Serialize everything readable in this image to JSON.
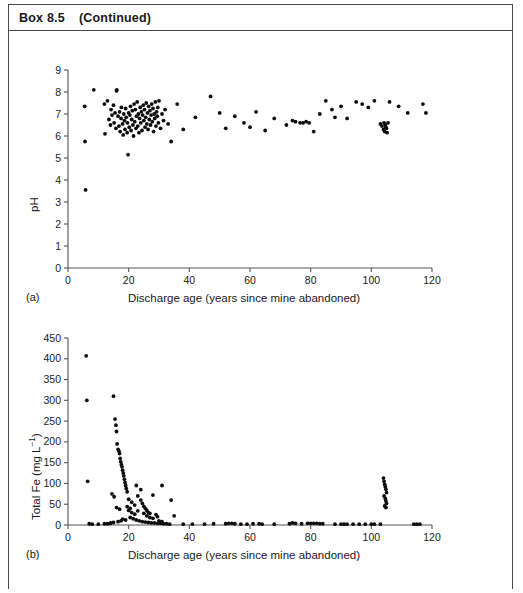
{
  "header": {
    "box_label": "Box 8.5",
    "continued_label": "(Continued)"
  },
  "chart_data": [
    {
      "type": "scatter",
      "panel": "(a)",
      "title": "",
      "xlabel": "Discharge age (years since mine abandoned)",
      "ylabel": "pH",
      "xlim": [
        0,
        120
      ],
      "ylim": [
        0,
        9
      ],
      "xticks": [
        0,
        20,
        40,
        60,
        80,
        100,
        120
      ],
      "yticks": [
        0,
        1,
        2,
        3,
        4,
        5,
        6,
        7,
        8,
        9
      ],
      "grid": false,
      "legend": "none",
      "marker": "filled-circle",
      "points": [
        [
          5.5,
          7.35
        ],
        [
          5.6,
          5.75
        ],
        [
          5.8,
          3.55
        ],
        [
          8.5,
          8.1
        ],
        [
          12.0,
          7.45
        ],
        [
          12.2,
          6.1
        ],
        [
          13.0,
          7.6
        ],
        [
          13.5,
          6.75
        ],
        [
          14.0,
          6.5
        ],
        [
          14.2,
          7.2
        ],
        [
          14.5,
          6.95
        ],
        [
          15.0,
          7.4
        ],
        [
          15.2,
          6.6
        ],
        [
          15.5,
          7.05
        ],
        [
          15.8,
          6.35
        ],
        [
          16.0,
          8.05
        ],
        [
          16.1,
          8.1
        ],
        [
          16.5,
          6.9
        ],
        [
          16.8,
          6.45
        ],
        [
          17.0,
          7.1
        ],
        [
          17.2,
          6.2
        ],
        [
          17.5,
          6.8
        ],
        [
          17.6,
          7.3
        ],
        [
          18.0,
          6.55
        ],
        [
          18.2,
          6.05
        ],
        [
          18.4,
          7.0
        ],
        [
          18.6,
          6.7
        ],
        [
          18.8,
          6.3
        ],
        [
          19.0,
          7.25
        ],
        [
          19.2,
          6.85
        ],
        [
          19.5,
          6.15
        ],
        [
          19.6,
          6.6
        ],
        [
          19.8,
          5.15
        ],
        [
          20.0,
          7.05
        ],
        [
          20.2,
          6.4
        ],
        [
          20.4,
          6.95
        ],
        [
          20.6,
          7.35
        ],
        [
          20.8,
          6.25
        ],
        [
          21.0,
          6.75
        ],
        [
          21.2,
          7.15
        ],
        [
          21.4,
          6.5
        ],
        [
          21.6,
          6.0
        ],
        [
          21.8,
          7.45
        ],
        [
          22.0,
          6.65
        ],
        [
          22.2,
          7.2
        ],
        [
          22.4,
          6.35
        ],
        [
          22.6,
          6.9
        ],
        [
          22.8,
          7.55
        ],
        [
          23.0,
          6.45
        ],
        [
          23.2,
          7.0
        ],
        [
          23.4,
          6.15
        ],
        [
          23.6,
          6.8
        ],
        [
          23.8,
          7.3
        ],
        [
          24.0,
          6.6
        ],
        [
          24.2,
          7.1
        ],
        [
          24.4,
          6.25
        ],
        [
          24.6,
          6.95
        ],
        [
          24.8,
          7.4
        ],
        [
          25.0,
          6.7
        ],
        [
          25.2,
          7.2
        ],
        [
          25.4,
          6.4
        ],
        [
          25.6,
          6.85
        ],
        [
          25.8,
          7.5
        ],
        [
          26.0,
          6.55
        ],
        [
          26.2,
          7.05
        ],
        [
          26.4,
          6.3
        ],
        [
          26.6,
          7.35
        ],
        [
          26.8,
          6.75
        ],
        [
          27.0,
          7.15
        ],
        [
          27.2,
          6.5
        ],
        [
          27.4,
          6.95
        ],
        [
          27.6,
          7.45
        ],
        [
          27.8,
          6.65
        ],
        [
          28.0,
          7.25
        ],
        [
          28.2,
          6.2
        ],
        [
          28.4,
          7.0
        ],
        [
          28.6,
          6.8
        ],
        [
          28.8,
          7.55
        ],
        [
          29.0,
          6.45
        ],
        [
          29.2,
          7.1
        ],
        [
          29.4,
          6.9
        ],
        [
          29.6,
          7.3
        ],
        [
          29.8,
          6.6
        ],
        [
          30.0,
          7.6
        ],
        [
          30.5,
          6.35
        ],
        [
          31.0,
          7.0
        ],
        [
          31.5,
          6.7
        ],
        [
          32.0,
          7.2
        ],
        [
          33.0,
          6.55
        ],
        [
          34.0,
          5.75
        ],
        [
          36.0,
          7.45
        ],
        [
          38.0,
          6.3
        ],
        [
          42.0,
          6.85
        ],
        [
          47.0,
          7.8
        ],
        [
          50.0,
          7.05
        ],
        [
          52.0,
          6.35
        ],
        [
          55.0,
          6.9
        ],
        [
          58.0,
          6.6
        ],
        [
          60.0,
          6.4
        ],
        [
          62.0,
          7.1
        ],
        [
          65.0,
          6.25
        ],
        [
          68.0,
          6.8
        ],
        [
          72.0,
          6.5
        ],
        [
          74.0,
          6.7
        ],
        [
          75.0,
          6.65
        ],
        [
          76.5,
          6.6
        ],
        [
          77.5,
          6.6
        ],
        [
          78.5,
          6.65
        ],
        [
          79.5,
          6.6
        ],
        [
          81.0,
          6.2
        ],
        [
          83.0,
          7.0
        ],
        [
          85.0,
          7.6
        ],
        [
          87.0,
          7.2
        ],
        [
          88.0,
          6.85
        ],
        [
          90.0,
          7.35
        ],
        [
          92.0,
          6.8
        ],
        [
          95.0,
          7.55
        ],
        [
          97.0,
          7.45
        ],
        [
          99.0,
          7.3
        ],
        [
          101.0,
          7.6
        ],
        [
          103.0,
          6.55
        ],
        [
          103.5,
          6.45
        ],
        [
          104.0,
          6.3
        ],
        [
          104.2,
          6.6
        ],
        [
          104.4,
          6.2
        ],
        [
          104.6,
          6.5
        ],
        [
          104.8,
          6.4
        ],
        [
          105.0,
          6.35
        ],
        [
          105.2,
          6.15
        ],
        [
          105.5,
          6.6
        ],
        [
          106.0,
          7.55
        ],
        [
          109.0,
          7.35
        ],
        [
          112.0,
          7.05
        ],
        [
          117.0,
          7.45
        ],
        [
          118.0,
          7.05
        ]
      ]
    },
    {
      "type": "scatter",
      "panel": "(b)",
      "title": "",
      "xlabel": "Discharge age (years since mine abandoned)",
      "ylabel": "Total Fe (mg L⁻¹)",
      "xlim": [
        0,
        120
      ],
      "ylim": [
        0,
        450
      ],
      "xticks": [
        0,
        20,
        40,
        60,
        80,
        100,
        120
      ],
      "yticks": [
        0,
        50,
        100,
        150,
        200,
        250,
        300,
        350,
        400,
        450
      ],
      "grid": false,
      "legend": "none",
      "marker": "filled-circle",
      "points": [
        [
          6.0,
          407
        ],
        [
          6.2,
          300
        ],
        [
          6.5,
          105
        ],
        [
          7.0,
          3
        ],
        [
          14.0,
          5
        ],
        [
          15.0,
          310
        ],
        [
          15.5,
          255
        ],
        [
          15.8,
          240
        ],
        [
          16.0,
          225
        ],
        [
          16.2,
          195
        ],
        [
          16.5,
          182
        ],
        [
          16.8,
          178
        ],
        [
          17.0,
          172
        ],
        [
          17.2,
          160
        ],
        [
          17.4,
          152
        ],
        [
          17.6,
          145
        ],
        [
          17.8,
          140
        ],
        [
          18.0,
          132
        ],
        [
          18.2,
          125
        ],
        [
          18.4,
          118
        ],
        [
          18.6,
          110
        ],
        [
          18.8,
          102
        ],
        [
          19.0,
          95
        ],
        [
          19.2,
          88
        ],
        [
          19.5,
          80
        ],
        [
          14.5,
          75
        ],
        [
          15.2,
          68
        ],
        [
          20.0,
          62
        ],
        [
          21.0,
          55
        ],
        [
          22.0,
          48
        ],
        [
          16.0,
          42
        ],
        [
          17.0,
          38
        ],
        [
          23.0,
          70
        ],
        [
          24.0,
          60
        ],
        [
          24.5,
          52
        ],
        [
          25.0,
          45
        ],
        [
          25.5,
          40
        ],
        [
          26.0,
          35
        ],
        [
          26.5,
          30
        ],
        [
          27.0,
          28
        ],
        [
          22.5,
          95
        ],
        [
          24.0,
          85
        ],
        [
          28.0,
          72
        ],
        [
          31.0,
          95
        ],
        [
          34.0,
          60
        ],
        [
          35.0,
          22
        ],
        [
          29.0,
          25
        ],
        [
          29.5,
          20
        ],
        [
          20.5,
          18
        ],
        [
          21.5,
          15
        ],
        [
          22.5,
          12
        ],
        [
          23.5,
          10
        ],
        [
          24.5,
          8
        ],
        [
          25.5,
          7
        ],
        [
          26.5,
          6
        ],
        [
          27.5,
          5
        ],
        [
          28.5,
          5
        ],
        [
          29.5,
          4
        ],
        [
          30.5,
          4
        ],
        [
          31.5,
          3
        ],
        [
          18.0,
          14
        ],
        [
          19.0,
          12
        ],
        [
          17.5,
          10
        ],
        [
          16.5,
          8
        ],
        [
          15.0,
          6
        ],
        [
          14.0,
          4
        ],
        [
          13.0,
          3
        ],
        [
          12.0,
          3
        ],
        [
          8.0,
          2
        ],
        [
          10.0,
          2
        ],
        [
          32.5,
          3
        ],
        [
          33.5,
          2
        ],
        [
          20.0,
          35
        ],
        [
          21.0,
          30
        ],
        [
          22.0,
          26
        ],
        [
          23.0,
          34
        ],
        [
          25.0,
          28
        ],
        [
          26.0,
          22
        ],
        [
          27.0,
          18
        ],
        [
          28.0,
          16
        ],
        [
          30.0,
          10
        ],
        [
          31.0,
          8
        ],
        [
          19.5,
          44
        ],
        [
          20.5,
          40
        ],
        [
          38.0,
          2
        ],
        [
          41.0,
          2
        ],
        [
          45.0,
          2
        ],
        [
          48.0,
          3
        ],
        [
          52.0,
          3
        ],
        [
          53.0,
          4
        ],
        [
          54.0,
          4
        ],
        [
          55.0,
          3
        ],
        [
          57.0,
          2
        ],
        [
          59.0,
          2
        ],
        [
          61.0,
          3
        ],
        [
          63.0,
          3
        ],
        [
          64.0,
          2
        ],
        [
          68.0,
          2
        ],
        [
          73.0,
          3
        ],
        [
          74.0,
          5
        ],
        [
          75.0,
          4
        ],
        [
          77.0,
          3
        ],
        [
          79.0,
          4
        ],
        [
          80.0,
          4
        ],
        [
          81.0,
          4
        ],
        [
          82.0,
          4
        ],
        [
          83.0,
          3
        ],
        [
          84.0,
          3
        ],
        [
          88.0,
          2
        ],
        [
          90.0,
          2
        ],
        [
          91.0,
          2
        ],
        [
          92.0,
          2
        ],
        [
          94.0,
          2
        ],
        [
          96.0,
          2
        ],
        [
          98.0,
          2
        ],
        [
          100.0,
          2
        ],
        [
          101.0,
          2
        ],
        [
          103.0,
          2
        ],
        [
          104.0,
          113
        ],
        [
          104.2,
          105
        ],
        [
          104.4,
          98
        ],
        [
          104.6,
          92
        ],
        [
          104.8,
          86
        ],
        [
          105.0,
          78
        ],
        [
          104.2,
          70
        ],
        [
          104.6,
          64
        ],
        [
          104.8,
          58
        ],
        [
          105.0,
          52
        ],
        [
          104.4,
          46
        ],
        [
          104.8,
          42
        ],
        [
          114.0,
          2
        ],
        [
          115.0,
          2
        ],
        [
          116.0,
          2
        ]
      ]
    }
  ]
}
